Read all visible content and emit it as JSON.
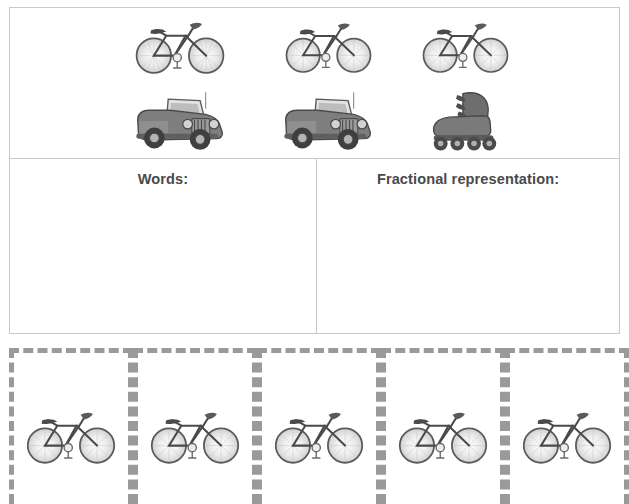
{
  "worksheet": {
    "picture_group": {
      "rows": [
        {
          "items": [
            {
              "icon": "bicycle-icon",
              "label": "bicycle"
            },
            {
              "icon": "bicycle-icon",
              "label": "bicycle"
            },
            {
              "icon": "bicycle-icon",
              "label": "bicycle"
            }
          ]
        },
        {
          "items": [
            {
              "icon": "jeep-icon",
              "label": "jeep"
            },
            {
              "icon": "jeep-icon",
              "label": "jeep"
            },
            {
              "icon": "rollerblade-icon",
              "label": "rollerblade"
            }
          ]
        }
      ]
    },
    "answer_row": {
      "words_label": "Words:",
      "fraction_label": "Fractional representation:",
      "words_value": "",
      "fraction_value": ""
    },
    "cutout_strip": {
      "cells": [
        {
          "icon": "bicycle-icon",
          "label": "bicycle"
        },
        {
          "icon": "bicycle-icon",
          "label": "bicycle"
        },
        {
          "icon": "bicycle-icon",
          "label": "bicycle"
        },
        {
          "icon": "bicycle-icon",
          "label": "bicycle"
        },
        {
          "icon": "bicycle-icon",
          "label": "bicycle"
        }
      ]
    },
    "colors": {
      "panel_border": "#c9c9c9",
      "dash_border": "#9a9a9a",
      "label_text": "#4a4a4a",
      "art_dark": "#4a4a4a",
      "art_mid": "#8d8d8d",
      "art_light": "#d8d8d8"
    }
  }
}
